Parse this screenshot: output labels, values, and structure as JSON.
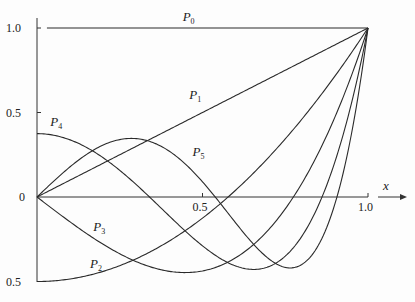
{
  "chart_data": {
    "type": "line",
    "title": "",
    "xlabel": "x",
    "ylabel": "",
    "xlim": [
      0,
      1.0
    ],
    "ylim": [
      -0.5,
      1.0
    ],
    "grid": false,
    "legend": "none (curve labels placed inline)",
    "x_ticks": [
      {
        "value": 0.5,
        "label": "0.5"
      },
      {
        "value": 1.0,
        "label": "1.0"
      }
    ],
    "y_ticks": [
      {
        "value": 1.0,
        "label": "1.0"
      },
      {
        "value": 0.5,
        "label": "0.5"
      },
      {
        "value": 0.0,
        "label": "0"
      },
      {
        "value": -0.5,
        "label": "0.5"
      }
    ],
    "series": [
      {
        "name": "P0",
        "formula": "1",
        "x": [
          0,
          0.25,
          0.5,
          0.75,
          1.0
        ],
        "values": [
          1,
          1,
          1,
          1,
          1
        ]
      },
      {
        "name": "P1",
        "formula": "x",
        "x": [
          0,
          0.25,
          0.5,
          0.75,
          1.0
        ],
        "values": [
          0,
          0.25,
          0.5,
          0.75,
          1.0
        ]
      },
      {
        "name": "P2",
        "formula": "(3x^2-1)/2",
        "x": [
          0,
          0.25,
          0.5,
          0.75,
          1.0
        ],
        "values": [
          -0.5,
          -0.406,
          -0.125,
          0.344,
          1.0
        ]
      },
      {
        "name": "P3",
        "formula": "(5x^3-3x)/2",
        "x": [
          0,
          0.25,
          0.5,
          0.75,
          1.0
        ],
        "values": [
          0,
          -0.336,
          -0.438,
          -0.07,
          1.0
        ]
      },
      {
        "name": "P4",
        "formula": "(35x^4-30x^2+3)/8",
        "x": [
          0,
          0.25,
          0.5,
          0.75,
          1.0
        ],
        "values": [
          0.375,
          0.209,
          -0.289,
          -0.209,
          1.0
        ]
      },
      {
        "name": "P5",
        "formula": "(63x^5-70x^3+15x)/8",
        "x": [
          0,
          0.25,
          0.5,
          0.75,
          1.0
        ],
        "values": [
          0,
          0.34,
          0.09,
          -0.365,
          1.0
        ]
      }
    ],
    "annotations": [
      {
        "text": "P",
        "sub": "0",
        "x": 0.44,
        "y": 1.04
      },
      {
        "text": "P",
        "sub": "1",
        "x": 0.46,
        "y": 0.58
      },
      {
        "text": "P",
        "sub": "2",
        "x": 0.16,
        "y": -0.42
      },
      {
        "text": "P",
        "sub": "3",
        "x": 0.17,
        "y": -0.2
      },
      {
        "text": "P",
        "sub": "4",
        "x": 0.04,
        "y": 0.42
      },
      {
        "text": "P",
        "sub": "5",
        "x": 0.47,
        "y": 0.24
      }
    ]
  },
  "axis": {
    "x_label": "x",
    "origin_label": "0"
  }
}
